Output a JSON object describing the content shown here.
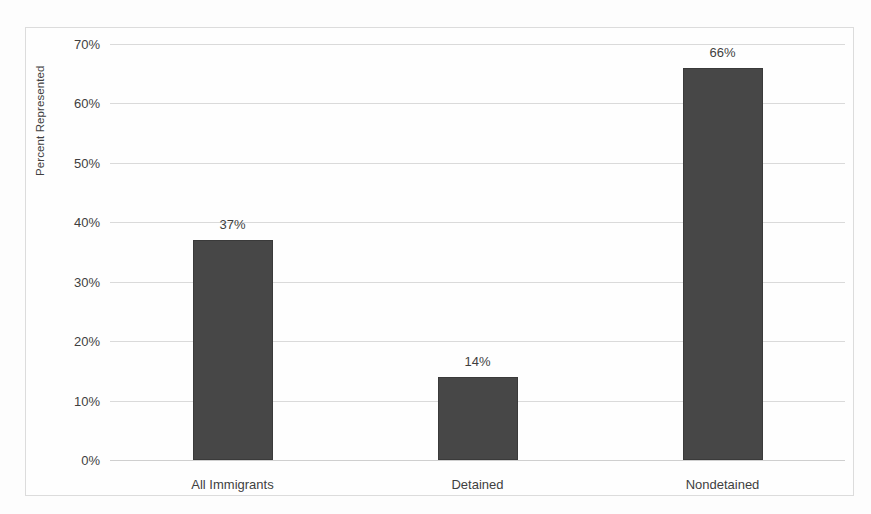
{
  "chart_data": {
    "type": "bar",
    "title": "",
    "subtitle": "",
    "xlabel": "",
    "ylabel": "Percent Represented",
    "categories": [
      "All Immigrants",
      "Detained",
      "Nondetained"
    ],
    "values": [
      37,
      14,
      66
    ],
    "value_labels": [
      "37%",
      "14%",
      "66%"
    ],
    "ylim": [
      0,
      70
    ],
    "ytick_values": [
      0,
      10,
      20,
      30,
      40,
      50,
      60,
      70
    ],
    "ytick_labels": [
      "0%",
      "10%",
      "20%",
      "30%",
      "40%",
      "50%",
      "60%",
      "70%"
    ],
    "grid": true,
    "legend": false,
    "legend_position": "none",
    "bar_color": "#474747",
    "gridline_color": "#dadada",
    "frame_color": "#dcdcdc",
    "text_color": "#3f3f3f",
    "background_color": "#fdfdfd"
  }
}
